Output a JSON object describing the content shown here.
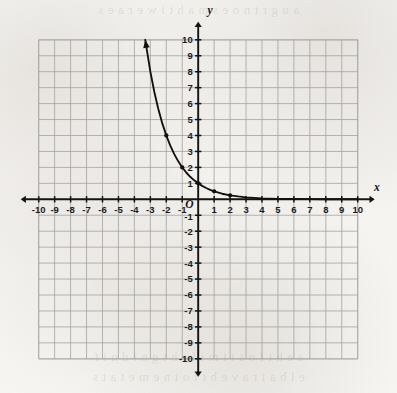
{
  "figure": {
    "kind": "coordinate-grid-graph",
    "background_color": "#f6f5f2",
    "grid_line_color": "#9a9a9a",
    "axis_color": "#141414",
    "curve_color": "#111111"
  },
  "bleed_through": {
    "top_text": "a u g r t n o e s m a h t i w e r a e s",
    "bottom_line_1": "a e h t f o s t i m i l e h t g n i d n i f",
    "bottom_line_2": "e l b a i r a v e h t f o t n e m e t a t s"
  },
  "labels": {
    "x_axis_name": "x",
    "y_axis_name": "y",
    "origin": "O"
  },
  "chart_data": {
    "type": "line",
    "title": "",
    "subtitle": "",
    "xlabel": "x",
    "ylabel": "y",
    "grid": true,
    "legend": "none",
    "xlim": [
      -10,
      10
    ],
    "ylim": [
      -10,
      10
    ],
    "x_ticks": [
      -10,
      -9,
      -8,
      -7,
      -6,
      -5,
      -4,
      -3,
      -2,
      -1,
      1,
      2,
      3,
      4,
      5,
      6,
      7,
      8,
      9,
      10
    ],
    "y_ticks": [
      10,
      9,
      8,
      7,
      6,
      5,
      4,
      3,
      2,
      1,
      -1,
      -2,
      -3,
      -4,
      -5,
      -6,
      -7,
      -8,
      -9,
      -10
    ],
    "x_tick_labels": [
      "-10",
      "-9",
      "-8",
      "-7",
      "-6",
      "-5",
      "-4",
      "-3",
      "-2",
      "-1",
      "1",
      "2",
      "3",
      "4",
      "5",
      "6",
      "7",
      "8",
      "9",
      "10"
    ],
    "y_tick_labels": [
      "10",
      "9",
      "8",
      "7",
      "6",
      "5",
      "4",
      "3",
      "2",
      "1",
      "-1",
      "-2",
      "-3",
      "-4",
      "-5",
      "-6",
      "-7",
      "-8",
      "-9",
      "-10"
    ],
    "series": [
      {
        "name": "y = (1/2)^x",
        "equation": "y = 2^(-x)",
        "arrow_start": true,
        "arrow_end": false,
        "x": [
          -3.32,
          -3.0,
          -2.75,
          -2.5,
          -2.25,
          -2.0,
          -1.75,
          -1.5,
          -1.25,
          -1.0,
          -0.75,
          -0.5,
          -0.25,
          0.0,
          0.25,
          0.5,
          0.75,
          1.0,
          1.5,
          2.0,
          2.5,
          3.0,
          4.0,
          5.0,
          6.0,
          7.0,
          8.0,
          9.0,
          10.0
        ],
        "y": [
          10.0,
          8.0,
          6.73,
          5.66,
          4.76,
          4.0,
          3.36,
          2.83,
          2.38,
          2.0,
          1.68,
          1.41,
          1.19,
          1.0,
          0.84,
          0.71,
          0.59,
          0.5,
          0.35,
          0.25,
          0.18,
          0.125,
          0.0625,
          0.031,
          0.016,
          0.008,
          0.004,
          0.002,
          0.001
        ]
      }
    ],
    "marked_points": [
      {
        "x": -2,
        "y": 4
      },
      {
        "x": -1,
        "y": 2
      },
      {
        "x": 0,
        "y": 1
      },
      {
        "x": 1,
        "y": 0.5
      },
      {
        "x": 2,
        "y": 0.25
      }
    ],
    "annotations": [
      {
        "text": "O",
        "x": -0.55,
        "y": -0.55,
        "role": "origin-label"
      },
      {
        "text": "x",
        "x": 11.2,
        "y": 0.55,
        "role": "x-axis-name"
      },
      {
        "text": "y",
        "x": 0.75,
        "y": 11.6,
        "role": "y-axis-name"
      }
    ]
  }
}
